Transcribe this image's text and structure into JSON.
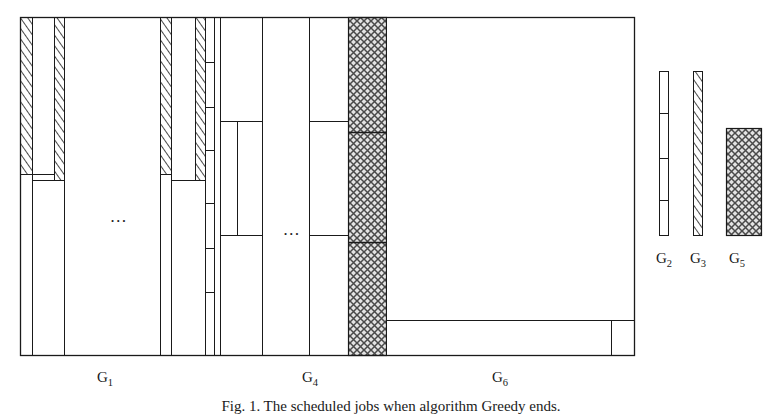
{
  "figure": {
    "caption": "Fig. 1. The scheduled jobs when algorithm Greedy ends.",
    "caption_prefix": "Fig. 1.",
    "caption_text": "The scheduled jobs when algorithm Greedy ends.",
    "frame": {
      "x": 20,
      "y": 17,
      "width": 614,
      "height": 339,
      "stroke": "#1a1a1a"
    },
    "group_labels": [
      {
        "name": "G1",
        "base": "G",
        "sub": "1",
        "x": 105,
        "y": 381
      },
      {
        "name": "G4",
        "base": "G",
        "sub": "4",
        "x": 310,
        "y": 381
      },
      {
        "name": "G6",
        "base": "G",
        "sub": "6",
        "x": 500,
        "y": 381
      }
    ],
    "ellipses": [
      {
        "name": "ellipsis-g1",
        "x": 119,
        "y": 222
      },
      {
        "name": "ellipsis-g4",
        "x": 292,
        "y": 235
      }
    ],
    "legend": {
      "items": [
        {
          "name": "G2",
          "base": "G",
          "sub": "2",
          "pattern": "plain-segmented",
          "x": 659,
          "y": 71,
          "width": 9,
          "height": 165,
          "label_x": 650,
          "label_y": 262,
          "dividers": [
            42,
            87,
            129
          ]
        },
        {
          "name": "G3",
          "base": "G",
          "sub": "3",
          "pattern": "diagonal-hatch",
          "x": 693,
          "y": 71,
          "width": 9,
          "height": 165,
          "label_x": 684,
          "label_y": 262,
          "dividers": []
        },
        {
          "name": "G5",
          "base": "G",
          "sub": "5",
          "pattern": "cross-hatch",
          "x": 726,
          "y": 128,
          "width": 35,
          "height": 108,
          "label_x": 719,
          "label_y": 262,
          "dividers": []
        }
      ]
    },
    "patterns": {
      "plain": "#ffffff",
      "diagonal_hatch": "diagonal lines",
      "cross_hatch": "crossed diagonal lines, gray",
      "stroke": "#1a1a1a"
    },
    "bars": [
      {
        "name": "g1-hatch-1",
        "pattern": "diagonal-hatch",
        "x": 20,
        "y": 17,
        "width": 12,
        "height": 157
      },
      {
        "name": "g1-plain-1",
        "pattern": "plain",
        "x": 20,
        "y": 174,
        "width": 12,
        "height": 182
      },
      {
        "name": "g1-plain-2",
        "pattern": "plain",
        "x": 32,
        "y": 17,
        "width": 22,
        "height": 157
      },
      {
        "name": "g1-hatch-2",
        "pattern": "diagonal-hatch",
        "x": 54,
        "y": 17,
        "width": 10,
        "height": 163
      },
      {
        "name": "g1-plain-3",
        "pattern": "plain",
        "x": 32,
        "y": 174,
        "width": 32,
        "height": 182
      },
      {
        "name": "g1-plain-4",
        "pattern": "plain",
        "x": 64,
        "y": 17,
        "width": 96,
        "height": 339
      },
      {
        "name": "g1-hatch-3",
        "pattern": "diagonal-hatch",
        "x": 160,
        "y": 17,
        "width": 11,
        "height": 157
      },
      {
        "name": "g1-plain-5",
        "pattern": "plain",
        "x": 171,
        "y": 17,
        "width": 24,
        "height": 163
      },
      {
        "name": "g1-hatch-4",
        "pattern": "diagonal-hatch",
        "x": 195,
        "y": 17,
        "width": 10,
        "height": 163
      },
      {
        "name": "g1-plain-6",
        "pattern": "plain",
        "x": 160,
        "y": 174,
        "width": 11,
        "height": 182
      },
      {
        "name": "g1-plain-7",
        "pattern": "plain",
        "x": 171,
        "y": 180,
        "width": 34,
        "height": 176
      },
      {
        "name": "g2-segmented",
        "pattern": "plain-segmented",
        "x": 226,
        "y": 17,
        "width": 9,
        "height": 339,
        "dividers": [
          45,
          90,
          133,
          186,
          231,
          275
        ]
      },
      {
        "name": "g4-plain-1",
        "pattern": "plain",
        "x": 235,
        "y": 17,
        "width": 42,
        "height": 105
      },
      {
        "name": "g4-plain-2",
        "pattern": "plain",
        "x": 235,
        "y": 122,
        "width": 42,
        "height": 114
      },
      {
        "name": "g4-plain-3",
        "pattern": "plain",
        "x": 235,
        "y": 236,
        "width": 42,
        "height": 120
      },
      {
        "name": "g4-plain-4",
        "pattern": "plain",
        "x": 277,
        "y": 17,
        "width": 35,
        "height": 339
      },
      {
        "name": "g4-plain-5",
        "pattern": "plain",
        "x": 312,
        "y": 17,
        "width": 36,
        "height": 105
      },
      {
        "name": "g4-plain-6",
        "pattern": "plain",
        "x": 312,
        "y": 122,
        "width": 36,
        "height": 114
      },
      {
        "name": "g4-plain-7",
        "pattern": "plain",
        "x": 312,
        "y": 236,
        "width": 36,
        "height": 120
      },
      {
        "name": "g5-cross",
        "pattern": "cross-hatch",
        "x": 348,
        "y": 17,
        "width": 38,
        "height": 339,
        "dividers": [
          132,
          222
        ]
      },
      {
        "name": "g6-plain-main",
        "pattern": "plain",
        "x": 386,
        "y": 17,
        "width": 248,
        "height": 303
      },
      {
        "name": "g6-plain-strip",
        "pattern": "plain",
        "x": 386,
        "y": 320,
        "width": 225,
        "height": 36
      },
      {
        "name": "g6-plain-right",
        "pattern": "plain",
        "x": 611,
        "y": 320,
        "width": 23,
        "height": 36
      }
    ]
  }
}
